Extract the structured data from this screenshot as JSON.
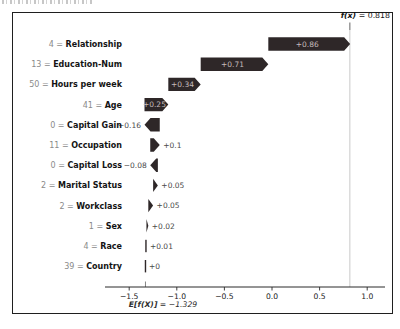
{
  "annotations": {
    "fx": {
      "prefix": "f(x)",
      "suffix": " = 0.818"
    },
    "ef": {
      "prefix": "E[f(X)]",
      "suffix": " = −1.329"
    }
  },
  "colors": {
    "bar": "#2e2728",
    "inside_label": "#c6bcbc",
    "outside_label": "#4a4a4a",
    "feature_name": "#141414",
    "feature_value": "#8a8a8a",
    "axis": "#2a2a2a",
    "tick_label": "#222222",
    "fx_line": "#c9c9c9",
    "frame": "#1f1f1f"
  },
  "chart_data": {
    "type": "bar",
    "subtype": "shap-waterfall",
    "title": "",
    "xlabel": "",
    "ylabel": "",
    "base_value": -1.329,
    "base_label": "E[f(X)] = −1.329",
    "final_value": 0.818,
    "final_label": "f(x) = 0.818",
    "xlim": [
      -1.75,
      1.19
    ],
    "x_ticks": [
      -1.5,
      -1.0,
      -0.5,
      0.0,
      0.5,
      1.0
    ],
    "x_tick_labels": [
      "−1.5",
      "−1.0",
      "−0.5",
      "0.0",
      "0.5",
      "1.0"
    ],
    "legend": null,
    "grid": false,
    "rows": [
      {
        "feature": "Relationship",
        "feature_value": "4",
        "shap": 0.86,
        "label": "+0.86",
        "label_position": "inside"
      },
      {
        "feature": "Education-Num",
        "feature_value": "13",
        "shap": 0.71,
        "label": "+0.71",
        "label_position": "inside"
      },
      {
        "feature": "Hours per week",
        "feature_value": "50",
        "shap": 0.34,
        "label": "+0.34",
        "label_position": "inside"
      },
      {
        "feature": "Age",
        "feature_value": "41",
        "shap": 0.25,
        "label": "+0.25",
        "label_position": "inside"
      },
      {
        "feature": "Capital Gain",
        "feature_value": "0",
        "shap": -0.16,
        "label": "−0.16",
        "label_position": "left"
      },
      {
        "feature": "Occupation",
        "feature_value": "11",
        "shap": 0.1,
        "label": "+0.1",
        "label_position": "right"
      },
      {
        "feature": "Capital Loss",
        "feature_value": "0",
        "shap": -0.08,
        "label": "−0.08",
        "label_position": "left"
      },
      {
        "feature": "Marital Status",
        "feature_value": "2",
        "shap": 0.05,
        "label": "+0.05",
        "label_position": "right"
      },
      {
        "feature": "Workclass",
        "feature_value": "2",
        "shap": 0.05,
        "label": "+0.05",
        "label_position": "right"
      },
      {
        "feature": "Sex",
        "feature_value": "1",
        "shap": 0.02,
        "label": "+0.02",
        "label_position": "right"
      },
      {
        "feature": "Race",
        "feature_value": "4",
        "shap": 0.01,
        "label": "+0.01",
        "label_position": "right"
      },
      {
        "feature": "Country",
        "feature_value": "39",
        "shap": 0.0,
        "label": "+0",
        "label_position": "right"
      }
    ]
  }
}
